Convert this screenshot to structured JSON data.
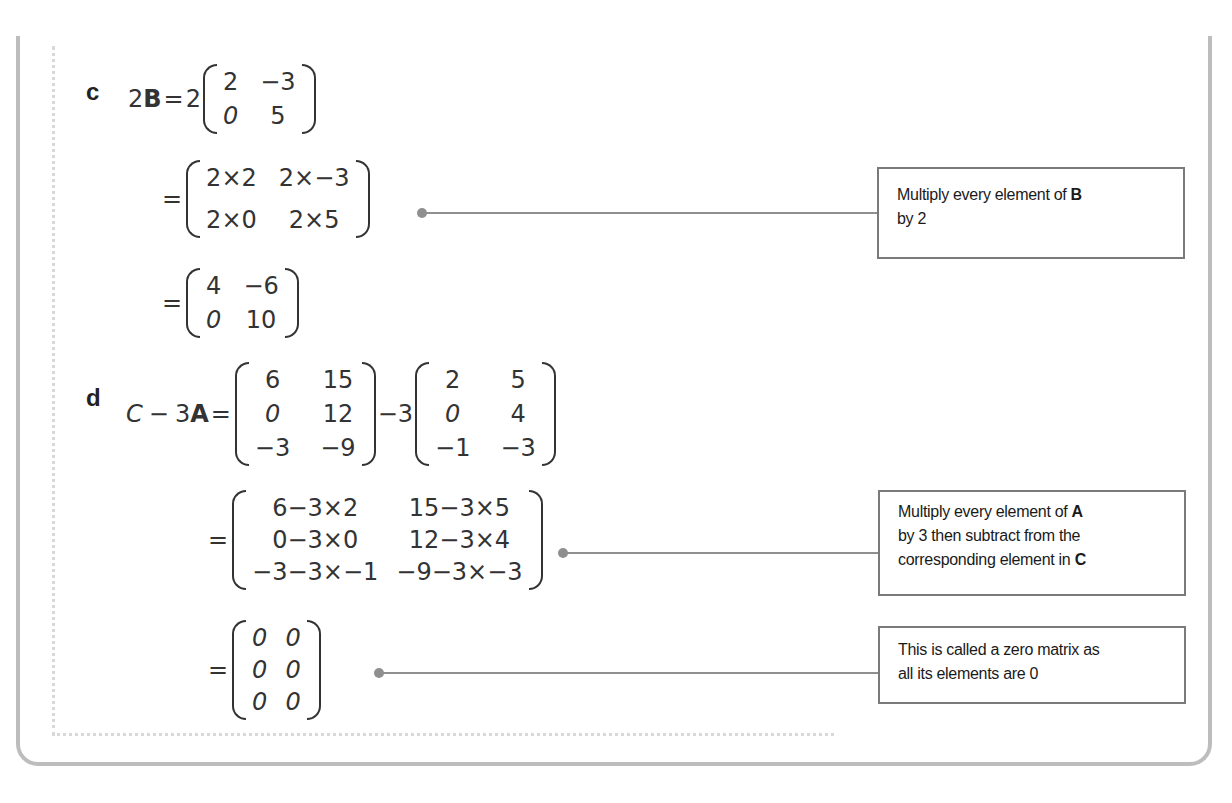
{
  "part_c": {
    "label": "c",
    "lhs_scalar": "2",
    "lhs_matrix_name": "B",
    "step1": {
      "scalar": "2",
      "matrix": [
        [
          "2",
          "-3"
        ],
        [
          "0",
          "5"
        ]
      ]
    },
    "step2": {
      "matrix": [
        [
          "2×2",
          "2×-3"
        ],
        [
          "2×0",
          "2×5"
        ]
      ]
    },
    "step3": {
      "matrix": [
        [
          "4",
          "-6"
        ],
        [
          "0",
          "10"
        ]
      ]
    },
    "note": {
      "text_before": "Multiply every element of ",
      "bold": "B",
      "text_after": "by 2"
    }
  },
  "part_d": {
    "label": "d",
    "lhs_matrix_c": "C",
    "lhs_minus": "−",
    "lhs_scalar": "3",
    "lhs_matrix_a": "A",
    "step1": {
      "matrix_c": [
        [
          "6",
          "15"
        ],
        [
          "0",
          "12"
        ],
        [
          "-3",
          "-9"
        ]
      ],
      "operator": "-3",
      "matrix_a": [
        [
          "2",
          "5"
        ],
        [
          "0",
          "4"
        ],
        [
          "-1",
          "-3"
        ]
      ]
    },
    "step2": {
      "matrix": [
        [
          "6-3×2",
          "15-3×5"
        ],
        [
          "0-3×0",
          "12-3×4"
        ],
        [
          "-3-3×-1",
          "-9-3×-3"
        ]
      ]
    },
    "step3": {
      "matrix": [
        [
          "0",
          "0"
        ],
        [
          "0",
          "0"
        ],
        [
          "0",
          "0"
        ]
      ]
    },
    "note1": {
      "text_before": "Multiply every element of ",
      "bold1": "A",
      "line2": "by 3 then subtract from the",
      "line3_before": "corresponding element in ",
      "bold2": "C"
    },
    "note2": {
      "line1": "This is called a zero matrix as",
      "line2": "all its elements are 0"
    }
  },
  "symbols": {
    "equals": "="
  }
}
